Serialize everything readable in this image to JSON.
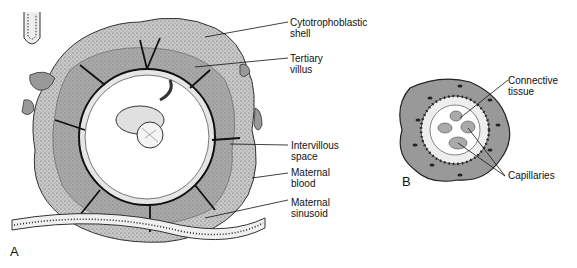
{
  "panels": {
    "a": {
      "letter": "A"
    },
    "b": {
      "letter": "B"
    }
  },
  "labels_a": [
    {
      "id": "cytotrophoblastic-shell",
      "text": "Cytotrophoblastic\nshell"
    },
    {
      "id": "tertiary-villus",
      "text": "Tertiary\nvillus"
    },
    {
      "id": "intervillous-space",
      "text": "Intervillous\nspace"
    },
    {
      "id": "maternal-blood",
      "text": "Maternal\nblood"
    },
    {
      "id": "maternal-sinusoid",
      "text": "Maternal\nsinusoid"
    }
  ],
  "labels_b": [
    {
      "id": "connective-tissue",
      "text": "Connective\ntissue"
    },
    {
      "id": "capillaries",
      "text": "Capillaries"
    }
  ],
  "colors": {
    "tissue_gray": "#9a9a9a",
    "dark_gray": "#6e6e6e",
    "stipple": "#bdbdbd",
    "line": "#111111",
    "background": "#ffffff"
  }
}
